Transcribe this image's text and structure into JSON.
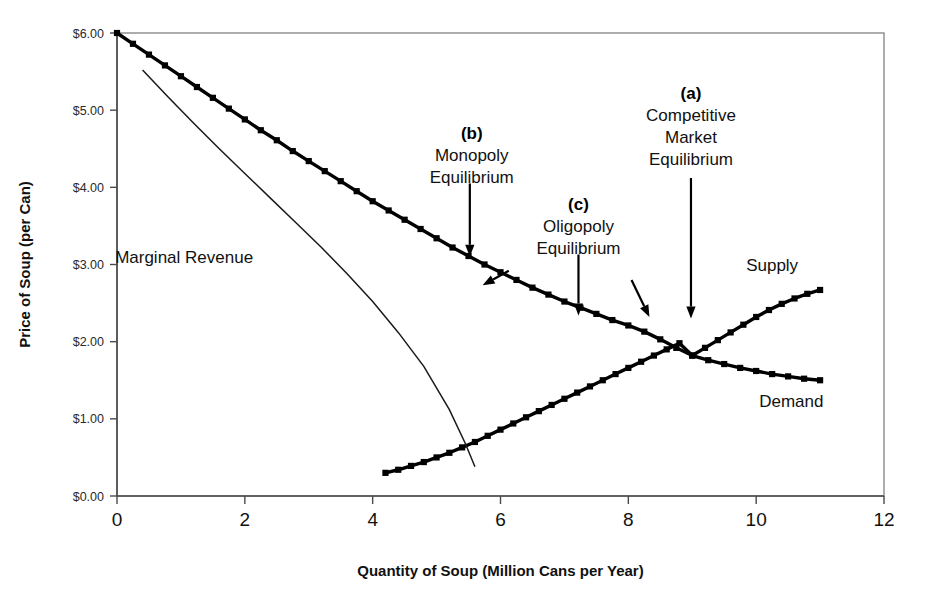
{
  "chart_data": {
    "type": "line",
    "title": "",
    "xlabel": "Quantity of Soup (Million Cans per Year)",
    "ylabel": "Price of Soup (per Can)",
    "xlim": [
      0,
      12
    ],
    "ylim": [
      0,
      6
    ],
    "grid": false,
    "legend_position": "inline-curve-labels",
    "x_tick_labels": [
      "0",
      "2",
      "4",
      "6",
      "8",
      "10",
      "12"
    ],
    "x_tick_values": [
      0,
      2,
      4,
      6,
      8,
      10,
      12
    ],
    "y_tick_labels": [
      "$0.00",
      "$1.00",
      "$2.00",
      "$3.00",
      "$4.00",
      "$5.00",
      "$6.00"
    ],
    "y_tick_values": [
      0,
      1,
      2,
      3,
      4,
      5,
      6
    ],
    "series": [
      {
        "name": "Demand",
        "style": "thick-squares",
        "label": "Demand",
        "label_x": 10.55,
        "label_y": 1.15,
        "points": [
          [
            0.0,
            6.0
          ],
          [
            0.25,
            5.86
          ],
          [
            0.5,
            5.72
          ],
          [
            0.75,
            5.58
          ],
          [
            1.0,
            5.44
          ],
          [
            1.25,
            5.3
          ],
          [
            1.5,
            5.16
          ],
          [
            1.75,
            5.02
          ],
          [
            2.0,
            4.88
          ],
          [
            2.25,
            4.74
          ],
          [
            2.5,
            4.61
          ],
          [
            2.75,
            4.47
          ],
          [
            3.0,
            4.34
          ],
          [
            3.25,
            4.21
          ],
          [
            3.5,
            4.08
          ],
          [
            3.75,
            3.95
          ],
          [
            4.0,
            3.82
          ],
          [
            4.25,
            3.7
          ],
          [
            4.5,
            3.58
          ],
          [
            4.75,
            3.46
          ],
          [
            5.0,
            3.34
          ],
          [
            5.25,
            3.22
          ],
          [
            5.5,
            3.11
          ],
          [
            5.75,
            3.0
          ],
          [
            6.0,
            2.9
          ],
          [
            6.25,
            2.8
          ],
          [
            6.5,
            2.7
          ],
          [
            6.75,
            2.61
          ],
          [
            7.0,
            2.52
          ],
          [
            7.25,
            2.44
          ],
          [
            7.5,
            2.36
          ],
          [
            7.75,
            2.28
          ],
          [
            8.0,
            2.21
          ],
          [
            8.25,
            2.13
          ],
          [
            8.5,
            2.03
          ],
          [
            8.75,
            1.92
          ],
          [
            9.0,
            1.82
          ],
          [
            9.25,
            1.76
          ],
          [
            9.5,
            1.71
          ],
          [
            9.75,
            1.66
          ],
          [
            10.0,
            1.62
          ],
          [
            10.25,
            1.58
          ],
          [
            10.5,
            1.55
          ],
          [
            10.75,
            1.52
          ],
          [
            11.0,
            1.5
          ]
        ]
      },
      {
        "name": "Supply",
        "style": "thick-squares",
        "label": "Supply",
        "label_x": 10.25,
        "label_y": 2.92,
        "points": [
          [
            4.2,
            0.3
          ],
          [
            4.4,
            0.34
          ],
          [
            4.6,
            0.39
          ],
          [
            4.8,
            0.44
          ],
          [
            5.0,
            0.5
          ],
          [
            5.2,
            0.56
          ],
          [
            5.4,
            0.63
          ],
          [
            5.6,
            0.7
          ],
          [
            5.8,
            0.78
          ],
          [
            6.0,
            0.86
          ],
          [
            6.2,
            0.94
          ],
          [
            6.4,
            1.02
          ],
          [
            6.6,
            1.1
          ],
          [
            6.8,
            1.18
          ],
          [
            7.0,
            1.26
          ],
          [
            7.2,
            1.34
          ],
          [
            7.4,
            1.42
          ],
          [
            7.6,
            1.5
          ],
          [
            7.8,
            1.58
          ],
          [
            8.0,
            1.66
          ],
          [
            8.2,
            1.74
          ],
          [
            8.4,
            1.82
          ],
          [
            8.6,
            1.9
          ],
          [
            8.8,
            1.98
          ],
          [
            9.0,
            1.82
          ],
          [
            9.2,
            1.92
          ],
          [
            9.4,
            2.02
          ],
          [
            9.6,
            2.12
          ],
          [
            9.8,
            2.22
          ],
          [
            10.0,
            2.32
          ],
          [
            10.2,
            2.41
          ],
          [
            10.4,
            2.49
          ],
          [
            10.6,
            2.56
          ],
          [
            10.8,
            2.62
          ],
          [
            11.0,
            2.67
          ]
        ]
      },
      {
        "name": "Marginal Revenue",
        "style": "thin-line",
        "label": "Marginal Revenue",
        "label_x": 1.05,
        "label_y": 3.02,
        "points": [
          [
            0.4,
            5.52
          ],
          [
            0.8,
            5.17
          ],
          [
            1.2,
            4.83
          ],
          [
            1.6,
            4.5
          ],
          [
            2.0,
            4.18
          ],
          [
            2.4,
            3.86
          ],
          [
            2.8,
            3.54
          ],
          [
            3.2,
            3.22
          ],
          [
            3.6,
            2.88
          ],
          [
            4.0,
            2.52
          ],
          [
            4.4,
            2.12
          ],
          [
            4.8,
            1.68
          ],
          [
            5.2,
            1.12
          ],
          [
            5.45,
            0.68
          ],
          [
            5.6,
            0.38
          ]
        ]
      }
    ],
    "annotations": [
      {
        "tag": "(b)",
        "lines": [
          "Monopoly",
          "Equilibrium"
        ],
        "tag_x": 5.55,
        "text_x": 5.55,
        "tag_y": 4.62,
        "arrow": {
          "type": "vertical",
          "x": 5.52,
          "y_from": 4.05,
          "y_to": 3.1
        }
      },
      {
        "tag": "(c)",
        "lines": [
          "Oligopoly",
          "Equilibrium"
        ],
        "tag_x": 7.22,
        "text_x": 7.22,
        "tag_y": 3.7,
        "arrow": {
          "type": "vertical",
          "x": 7.22,
          "y_from": 3.13,
          "y_to": 2.34
        }
      },
      {
        "tag": "(a)",
        "lines": [
          "Competitive",
          "Market",
          "Equilibrium"
        ],
        "tag_x": 8.98,
        "text_x": 8.98,
        "tag_y": 5.15,
        "arrow": {
          "type": "vertical",
          "x": 8.98,
          "y_from": 4.12,
          "y_to": 2.3
        }
      }
    ],
    "pointer_arrows": [
      {
        "name": "monopoly-point-arrow",
        "x_from": 6.13,
        "y_from": 2.92,
        "x_to": 5.72,
        "y_to": 2.73
      },
      {
        "name": "oligopoly-point-arrow",
        "x_from": 8.05,
        "y_from": 2.8,
        "x_to": 8.33,
        "y_to": 2.32
      }
    ],
    "equilibria": {
      "competitive": {
        "quantity": 9.0,
        "price": 1.78
      },
      "monopoly": {
        "quantity": 5.5,
        "price": 3.11
      },
      "oligopoly": {
        "quantity": 7.2,
        "price": 2.45
      }
    }
  },
  "colors": {
    "curve": "#000000",
    "frame": "#8a8a8a",
    "axis": "#4a4a4a",
    "text": "#111111",
    "background": "#ffffff"
  }
}
